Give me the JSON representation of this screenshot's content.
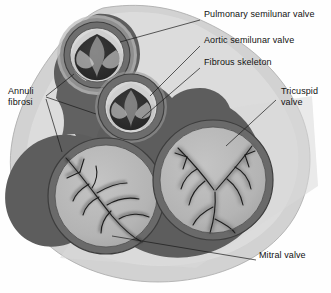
{
  "figure": {
    "type": "anatomical-diagram",
    "background_color": "#fefefe",
    "text_color": "#111111"
  },
  "palette": {
    "outer_tissue": "#cfcfcf",
    "outer_tissue_light": "#dcdcdc",
    "fibrous_skeleton": "#5d5d5d",
    "annulus_ring": "#6a6a6a",
    "valve_field": "#b6b6b6",
    "lumen_dark": "#2e2e2e",
    "cusp_light": "#e6e6e6",
    "cusp_mid": "#9a9a9a",
    "leader_line": "#1a1a1a",
    "outline": "#4a4a4a"
  },
  "labels": [
    {
      "id": "pulmonary-semilunar-valve",
      "text": "Pulmonary semilunar valve",
      "x": 204,
      "y": 14,
      "leader": [
        [
          200,
          20
        ],
        [
          120,
          42
        ]
      ]
    },
    {
      "id": "aortic-semilunar-valve",
      "text": "Aortic semilunar valve",
      "x": 204,
      "y": 40,
      "leader": [
        [
          200,
          46
        ],
        [
          150,
          96
        ]
      ]
    },
    {
      "id": "fibrous-skeleton",
      "text": "Fibrous skeleton",
      "x": 204,
      "y": 62,
      "leader": [
        [
          200,
          68
        ],
        [
          142,
          118
        ]
      ]
    },
    {
      "id": "tricuspid-valve",
      "text": "Tricuspid valve",
      "line1": "Tricuspid",
      "line2": "valve",
      "x": 278,
      "y": 92,
      "leader": [
        [
          276,
          100
        ],
        [
          226,
          146
        ]
      ]
    },
    {
      "id": "annuli-fibrosi",
      "text": "Annuli fibrosi",
      "line1": "Annuli",
      "line2": "fibrosi",
      "x": 10,
      "y": 92,
      "leaders": [
        [
          [
            46,
            96
          ],
          [
            74,
            74
          ]
        ],
        [
          [
            46,
            97
          ],
          [
            96,
            114
          ]
        ],
        [
          [
            46,
            99
          ],
          [
            62,
            152
          ]
        ]
      ]
    },
    {
      "id": "mitral-valve",
      "text": "Mitral valve",
      "x": 258,
      "y": 256,
      "leader": [
        [
          256,
          260
        ],
        [
          112,
          236
        ]
      ]
    }
  ],
  "structures": [
    {
      "id": "pulmonary-valve",
      "name": "Pulmonary semilunar valve",
      "cusps": 3,
      "center": [
        97,
        55
      ],
      "radius": 37
    },
    {
      "id": "aortic-valve",
      "name": "Aortic semilunar valve",
      "cusps": 3,
      "center": [
        131,
        107
      ],
      "radius": 33
    },
    {
      "id": "mitral-valve",
      "name": "Mitral valve",
      "cusps": 2,
      "center": [
        106,
        196
      ],
      "radius": 55
    },
    {
      "id": "tricuspid-valve",
      "name": "Tricuspid valve",
      "cusps": 3,
      "center": [
        213,
        180
      ],
      "radius": 57
    },
    {
      "id": "fibrous-skeleton",
      "name": "Fibrous skeleton",
      "role": "dark connective framework joining all four annuli"
    },
    {
      "id": "annuli-fibrosi",
      "name": "Annuli fibrosi",
      "role": "fibrous rings surrounding each valve orifice"
    }
  ]
}
